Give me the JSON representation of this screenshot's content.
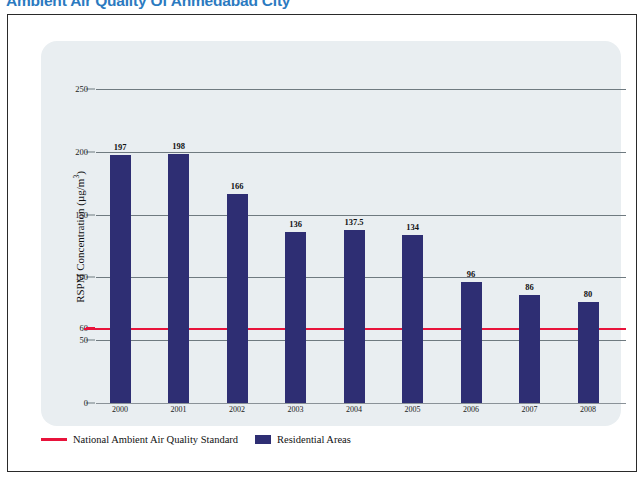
{
  "chart_title": "Ambient Air Quality Of Ahmedabad City",
  "accent_color": "#2b7ac0",
  "bar_color": "#2e2e73",
  "standard_line_color": "#e8133b",
  "panel_color": "#e9eef1",
  "y_axis_title_main": "RSPM  Concentration (µg/m",
  "y_axis_title_sup": "3",
  "y_axis_title_close": ")",
  "legend": {
    "standard_label": "National Ambient Air Quality Standard",
    "residential_label": "Residential  Areas"
  },
  "chart_data": {
    "type": "bar",
    "title": "Ambient Air Quality Of Ahmedabad City",
    "xlabel": "",
    "ylabel": "RSPM Concentration (µg/m3)",
    "categories": [
      "2000",
      "2001",
      "2002",
      "2003",
      "2004",
      "2005",
      "2006",
      "2007",
      "2008"
    ],
    "series": [
      {
        "name": "Residential  Areas",
        "color": "#2e2e73",
        "values": [
          197,
          198,
          166,
          136,
          137.5,
          134,
          96,
          86,
          80
        ],
        "labels": [
          "197",
          "198",
          "166",
          "136",
          "137.5",
          "134",
          "96",
          "86",
          "80"
        ]
      }
    ],
    "reference_lines": [
      {
        "name": "National Ambient Air Quality Standard",
        "value": 60,
        "color": "#e8133b"
      }
    ],
    "ylim": [
      0,
      265
    ],
    "yticks": [
      0,
      50,
      60,
      100,
      150,
      200,
      250
    ],
    "ytick_labels": [
      "0",
      "50",
      "60",
      "100",
      "150",
      "200",
      "250"
    ],
    "grid": true,
    "legend_position": "bottom-left"
  }
}
